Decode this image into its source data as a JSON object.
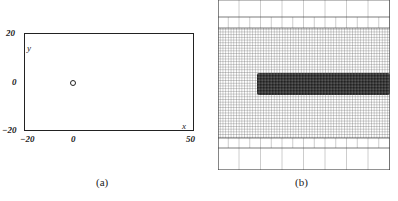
{
  "panel_a": {
    "caption": "(a)",
    "y_ticks": [
      "20",
      "0",
      "−20"
    ],
    "x_ticks": [
      "−20",
      "0",
      "50"
    ],
    "x_label": "x",
    "y_label": "y",
    "marker": {
      "x": 0,
      "y": 0,
      "shape": "circle"
    },
    "xlim": [
      -20,
      50
    ],
    "ylim": [
      -20,
      20
    ]
  },
  "panel_b": {
    "caption": "(b)",
    "description": "Adaptive mesh refinement grid with coarse, medium and fine levels and a dark refined band (wake) to the right"
  }
}
